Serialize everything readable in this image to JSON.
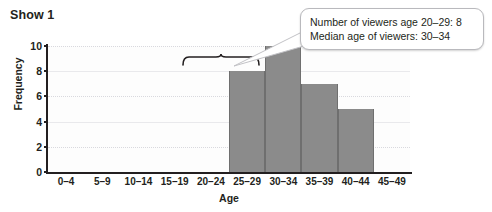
{
  "chart_data": {
    "type": "bar",
    "title": "Show 1",
    "xlabel": "Age",
    "ylabel": "Frequency",
    "categories": [
      "0–4",
      "5–9",
      "10–14",
      "15–19",
      "20–24",
      "25–29",
      "30–34",
      "35–39",
      "40–44",
      "45–49"
    ],
    "values": [
      0,
      0,
      0,
      0,
      0,
      8,
      10,
      7,
      5,
      0
    ],
    "ylim": [
      0,
      10
    ],
    "yticks": [
      0,
      2,
      4,
      6,
      8,
      10
    ],
    "grid": true,
    "legend": "none",
    "bar_color": "#8b8b8b",
    "annotations": [
      {
        "name": "brace",
        "spans": [
          "20–24",
          "25–29"
        ],
        "description": "curly brace spanning the 20–24 and 25–29 bins"
      },
      {
        "name": "callout",
        "lines": [
          "Number of viewers age 20–29: 8",
          "Median age of viewers: 30–34"
        ]
      }
    ]
  },
  "callout": {
    "line1": "Number of viewers age 20–29: 8",
    "line2": "Median age of viewers: 30–34"
  }
}
